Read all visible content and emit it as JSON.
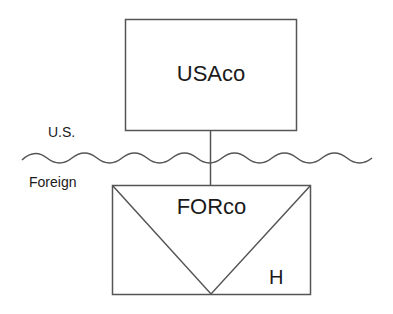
{
  "diagram": {
    "type": "tax-structure",
    "parent": {
      "label": "USAco"
    },
    "subsidiary": {
      "label": "FORco",
      "marker": "H"
    },
    "jurisdictions": {
      "upper": "U.S.",
      "lower": "Foreign"
    },
    "colors": {
      "stroke": "#555555",
      "text": "#1a1a1a",
      "background": "#ffffff"
    }
  }
}
